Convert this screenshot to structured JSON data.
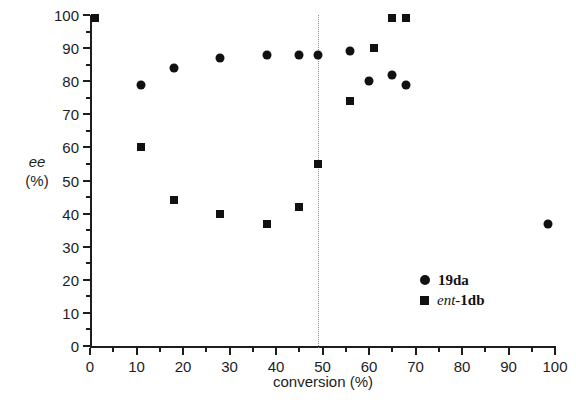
{
  "chart_data": {
    "type": "scatter",
    "title": "",
    "xlabel": "conversion (%)",
    "ylabel_main": "ee",
    "ylabel_unit": "(%)",
    "xlim": [
      0,
      100
    ],
    "ylim": [
      0,
      100
    ],
    "x_major_ticks": [
      0,
      10,
      20,
      30,
      40,
      50,
      60,
      70,
      80,
      90,
      100
    ],
    "x_minor_ticks": [
      5,
      15,
      25,
      35,
      45,
      55,
      65,
      75,
      85,
      95
    ],
    "y_major_ticks": [
      0,
      10,
      20,
      30,
      40,
      50,
      60,
      70,
      80,
      90,
      100
    ],
    "y_minor_ticks": [
      5,
      15,
      25,
      35,
      45,
      55,
      65,
      75,
      85,
      95
    ],
    "grid": false,
    "legend_position": "inside-bottom-right",
    "annotations": [
      {
        "type": "vertical-dotted-line",
        "x": 49,
        "label": ""
      }
    ],
    "series": [
      {
        "name": "19da",
        "name_prefix_italic": "",
        "marker": "circle",
        "color": "#111111",
        "points": [
          {
            "x": 11,
            "y": 79
          },
          {
            "x": 18,
            "y": 84
          },
          {
            "x": 28,
            "y": 87
          },
          {
            "x": 38,
            "y": 88
          },
          {
            "x": 45,
            "y": 88
          },
          {
            "x": 49,
            "y": 88
          },
          {
            "x": 56,
            "y": 89
          },
          {
            "x": 60,
            "y": 80
          },
          {
            "x": 65,
            "y": 82
          },
          {
            "x": 68,
            "y": 79
          },
          {
            "x": 98.5,
            "y": 37
          }
        ]
      },
      {
        "name": "1db",
        "name_prefix_italic": "ent-",
        "marker": "square",
        "color": "#111111",
        "points": [
          {
            "x": 1,
            "y": 99
          },
          {
            "x": 11,
            "y": 60
          },
          {
            "x": 18,
            "y": 44
          },
          {
            "x": 28,
            "y": 40
          },
          {
            "x": 38,
            "y": 37
          },
          {
            "x": 45,
            "y": 42
          },
          {
            "x": 49,
            "y": 55
          },
          {
            "x": 56,
            "y": 74
          },
          {
            "x": 61,
            "y": 90
          },
          {
            "x": 65,
            "y": 99
          },
          {
            "x": 68,
            "y": 99
          }
        ]
      }
    ]
  }
}
